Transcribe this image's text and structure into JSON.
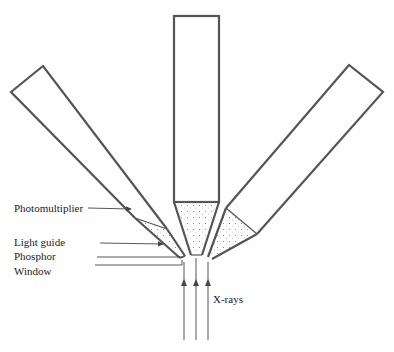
{
  "diagram": {
    "type": "schematic",
    "labels": {
      "photomultiplier": "Photomultiplier",
      "light_guide": "Light guide",
      "phosphor": "Phosphor",
      "window": "Window",
      "xrays": "X-rays"
    },
    "colors": {
      "line": "#555555",
      "text": "#222222",
      "background": "#ffffff"
    }
  }
}
